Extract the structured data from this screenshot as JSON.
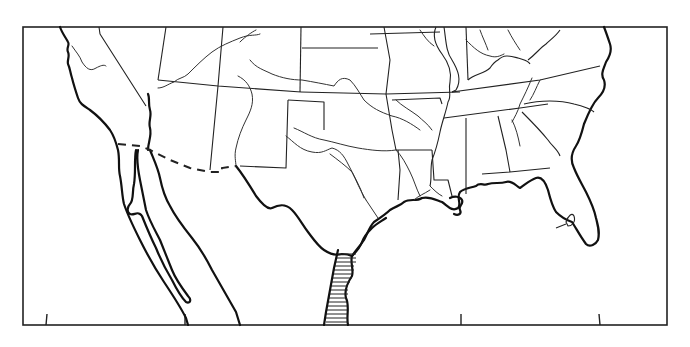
{
  "map": {
    "title": "",
    "style": "black-and-white line drawing",
    "region": "Southern United States and northern Mexico",
    "colors": {
      "background": "#ffffff",
      "ink": "#222222"
    },
    "frame": {
      "left": 23,
      "top": 27,
      "right": 667,
      "bottom": 325
    },
    "bottom_ticks_x": [
      46,
      185,
      461,
      600
    ],
    "features": {
      "coastline": "Pacific coast, Gulf of California, Gulf of Mexico, Atlantic coast",
      "state_boundaries": true,
      "rivers": true,
      "international_border": "dashed US–Mexico border",
      "hatched_area": "Gulf coast of Texas / northeastern Mexico near the Rio Grande mouth"
    }
  }
}
